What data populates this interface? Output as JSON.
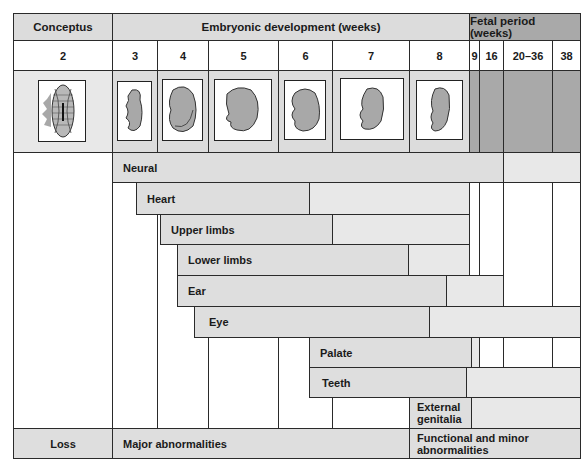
{
  "header": {
    "conceptus": "Conceptus",
    "embryonic": "Embryonic development (weeks)",
    "fetal": "Fetal period (weeks)"
  },
  "weeks": [
    "2",
    "3",
    "4",
    "5",
    "6",
    "7",
    "8",
    "9",
    "16",
    "20–36",
    "38"
  ],
  "images": [
    {
      "week": "2",
      "icon": "conceptus-icon"
    },
    {
      "week": "3",
      "icon": "embryo-week3-icon"
    },
    {
      "week": "4",
      "icon": "embryo-week4-icon"
    },
    {
      "week": "5",
      "icon": "embryo-week5-icon"
    },
    {
      "week": "6",
      "icon": "embryo-week6-icon"
    },
    {
      "week": "7",
      "icon": "embryo-week7-icon"
    },
    {
      "week": "8",
      "icon": "embryo-week8-icon"
    }
  ],
  "organs": [
    {
      "label": "Neural",
      "start_week": "3",
      "critical_end": "9",
      "minor_end": "38"
    },
    {
      "label": "Heart",
      "start_week": "3",
      "critical_end": "6",
      "minor_end": "8"
    },
    {
      "label": "Upper limbs",
      "start_week": "4",
      "critical_end": "7",
      "minor_end": "8"
    },
    {
      "label": "Lower limbs",
      "start_week": "4",
      "critical_end": "8",
      "minor_end": "8"
    },
    {
      "label": "Ear",
      "start_week": "4",
      "critical_end": "8",
      "minor_end": "16"
    },
    {
      "label": "Eye",
      "start_week": "4",
      "critical_end": "8",
      "minor_end": "38"
    },
    {
      "label": "Palate",
      "start_week": "6",
      "critical_end": "8",
      "minor_end": "9"
    },
    {
      "label": "Teeth",
      "start_week": "6",
      "critical_end": "8",
      "minor_end": "38"
    },
    {
      "label": "External genitalia",
      "label_line1": "External",
      "label_line2": "genitalia",
      "start_week": "8",
      "critical_end": "9",
      "minor_end": "38"
    }
  ],
  "footer": {
    "loss": "Loss",
    "major": "Major abnormalities",
    "minor_line1": "Functional and minor",
    "minor_line2": "abnormalities"
  },
  "colors": {
    "header_gray": "#dcdcdc",
    "fetal_gray": "#a9a9a9",
    "bar_gray": "#dedede",
    "border": "#2a2a2a"
  }
}
